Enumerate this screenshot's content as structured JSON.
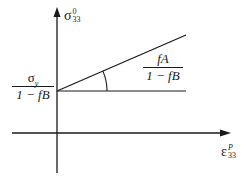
{
  "diagram": {
    "y_axis": {
      "symbol": "σ",
      "superscript": "0",
      "subscript": "33"
    },
    "x_axis": {
      "symbol": "ε",
      "superscript": "P",
      "subscript": "33"
    },
    "intercept_label": {
      "numerator_symbol": "σ",
      "numerator_subscript": "y",
      "denominator": "1 − fB"
    },
    "slope_label": {
      "numerator": "fA",
      "denominator": "1 − fB"
    },
    "colors": {
      "line": "#1a1a1a",
      "background": "#ffffff"
    }
  }
}
